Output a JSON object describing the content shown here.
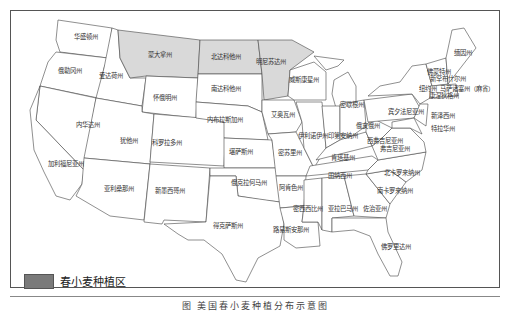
{
  "map": {
    "title": "美国春小麦种植分布示意图",
    "caption": "图  美国春小麦种植分布示意图",
    "legend": {
      "label": "春小麦种植区",
      "swatch_color": "#7a7a7a"
    },
    "states": {
      "washington": "华盛顿州",
      "oregon": "俄勒冈州",
      "idaho": "爱达荷州",
      "montana": "蒙大拿州",
      "wyoming": "怀俄明州",
      "nevada": "内华达州",
      "utah": "犹他州",
      "california": "加利福尼亚州",
      "arizona": "亚利桑那州",
      "colorado": "科罗拉多州",
      "new_mexico": "新墨西哥州",
      "north_dakota": "北达科他州",
      "south_dakota": "南达科他州",
      "nebraska": "内布拉斯加州",
      "kansas": "堪萨斯州",
      "oklahoma": "俄克拉何马州",
      "texas": "得克萨斯州",
      "minnesota": "明尼苏达州",
      "iowa": "艾奥瓦州",
      "missouri": "密苏里州",
      "arkansas": "阿肯色州",
      "louisiana": "路易斯安那州",
      "wisconsin": "威斯康星州",
      "michigan": "密歇根州",
      "illinois_indiana": "伊利诺伊州印第安纳州",
      "ohio": "俄亥俄州",
      "kentucky": "肯塔基州",
      "tennessee": "田纳西州",
      "mississippi": "密西西比州",
      "alabama": "亚拉巴马州",
      "georgia": "佐治亚州",
      "florida": "佛罗里达州",
      "south_carolina": "南卡罗来纳州",
      "north_carolina": "北卡罗来纳州",
      "virginia": "弗吉尼亚州",
      "west_virginia": "西弗吉尼亚州",
      "pennsylvania": "宾夕法尼亚州",
      "new_york": "纽约州",
      "new_jersey": "新泽西州",
      "delaware": "特拉华州",
      "vermont": "佛蒙特州",
      "new_hampshire": "新罕布什尔州",
      "massachusetts": "马萨诸塞州（麻省）",
      "connecticut": "康涅狄格州",
      "maine": "缅因州"
    },
    "colors": {
      "border": "#444444",
      "wheat_area": "#d9d9d9",
      "background": "#ffffff"
    }
  }
}
